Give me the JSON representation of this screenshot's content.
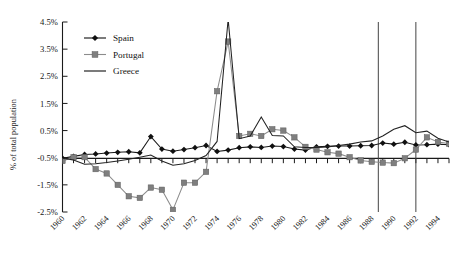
{
  "chart_data": {
    "type": "line",
    "title": "",
    "xlabel": "",
    "ylabel": "% of total population",
    "ylim": [
      -2.5,
      4.5
    ],
    "ytick_labels": [
      "4.5%",
      "3.5%",
      "2.5%",
      "1.5%",
      "0.5%",
      "-0.5%",
      "-1.5%",
      "-2.5%"
    ],
    "ytick_values": [
      4.5,
      3.5,
      2.5,
      1.5,
      0.5,
      -0.5,
      -1.5,
      -2.5
    ],
    "xlim": [
      1960,
      1995
    ],
    "xtick_labels": [
      "1960",
      "1962",
      "1964",
      "1966",
      "1968",
      "1970",
      "1972",
      "1974",
      "1976",
      "1978",
      "1980",
      "1982",
      "1984",
      "1986",
      "1988",
      "1990",
      "1992",
      "1994"
    ],
    "xtick_values": [
      1960,
      1962,
      1964,
      1966,
      1968,
      1970,
      1972,
      1974,
      1976,
      1978,
      1980,
      1982,
      1984,
      1986,
      1988,
      1990,
      1992,
      1994
    ],
    "grid": false,
    "legend_position": "top-left",
    "x": [
      1960,
      1961,
      1962,
      1963,
      1964,
      1965,
      1966,
      1967,
      1968,
      1969,
      1970,
      1971,
      1972,
      1973,
      1974,
      1975,
      1976,
      1977,
      1978,
      1979,
      1980,
      1981,
      1982,
      1983,
      1984,
      1985,
      1986,
      1987,
      1988,
      1989,
      1990,
      1991,
      1992,
      1993,
      1994,
      1995
    ],
    "series": [
      {
        "name": "Spain",
        "color": "#101010",
        "marker": "diamond",
        "values": [
          -0.52,
          -0.45,
          -0.38,
          -0.36,
          -0.33,
          -0.3,
          -0.28,
          -0.32,
          0.28,
          -0.18,
          -0.26,
          -0.2,
          -0.13,
          -0.05,
          -0.27,
          -0.22,
          -0.13,
          -0.1,
          -0.12,
          -0.07,
          -0.09,
          -0.18,
          -0.22,
          -0.1,
          -0.08,
          -0.07,
          -0.07,
          -0.06,
          -0.05,
          0.04,
          0.0,
          0.07,
          -0.03,
          -0.02,
          0.0,
          -0.02
        ]
      },
      {
        "name": "Portugal",
        "color": "#7f7f7f",
        "marker": "square",
        "values": [
          -0.62,
          -0.48,
          -0.48,
          -0.92,
          -1.08,
          -1.5,
          -1.92,
          -1.98,
          -1.6,
          -1.68,
          -2.42,
          -1.42,
          -1.42,
          -1.02,
          1.95,
          3.78,
          0.3,
          0.38,
          0.3,
          0.55,
          0.5,
          0.25,
          -0.1,
          -0.2,
          -0.3,
          -0.35,
          -0.48,
          -0.6,
          -0.65,
          -0.68,
          -0.7,
          -0.52,
          -0.2,
          0.25,
          0.08,
          0.02
        ]
      },
      {
        "name": "Greece",
        "color": "#222222",
        "marker": "none",
        "values": [
          -0.52,
          -0.58,
          -0.74,
          -0.72,
          -0.68,
          -0.62,
          -0.56,
          -0.48,
          -0.4,
          -0.62,
          -0.78,
          -0.72,
          -0.6,
          -0.42,
          0.1,
          4.6,
          0.2,
          0.3,
          1.0,
          0.32,
          0.3,
          -0.1,
          -0.12,
          -0.12,
          -0.1,
          -0.05,
          0.0,
          0.08,
          0.12,
          0.3,
          0.55,
          0.68,
          0.42,
          0.48,
          0.22,
          0.08
        ]
      }
    ],
    "vertical_reference_lines": [
      1988.6,
      1992.0
    ],
    "annotations": []
  },
  "legend": {
    "items": [
      {
        "label": "Spain",
        "icon": "diamond-marker-icon"
      },
      {
        "label": "Portugal",
        "icon": "square-marker-icon"
      },
      {
        "label": "Greece",
        "icon": "line-marker-icon"
      }
    ]
  }
}
